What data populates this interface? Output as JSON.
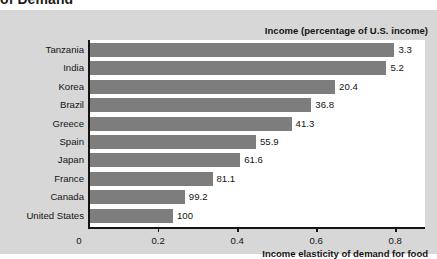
{
  "figure": {
    "clipped_caption": "of Demand",
    "header_note": "Income (percentage of U.S. income)",
    "x_axis_title": "Income elasticity of demand for food"
  },
  "colors": {
    "panel_background": "#d7d7d7",
    "plot_background": "#ffffff",
    "bar_fill": "#7d7d7d",
    "axis": "#141414",
    "text": "#141414"
  },
  "chart_data": {
    "type": "bar",
    "orientation": "horizontal",
    "title": "of Demand",
    "xlabel": "Income elasticity of demand for food",
    "ylabel": "",
    "xlim": [
      0,
      0.85
    ],
    "ticks": [
      "0",
      "0.2",
      "0.4",
      "0.6",
      "0.8"
    ],
    "tick_values": [
      0,
      0.2,
      0.4,
      0.6,
      0.8
    ],
    "grid": false,
    "legend": "none",
    "value_label_header": "Income (percentage of U.S. income)",
    "categories": [
      "Tanzania",
      "India",
      "Korea",
      "Brazil",
      "Greece",
      "Spain",
      "Japan",
      "France",
      "Canada",
      "United States"
    ],
    "values": [
      0.77,
      0.75,
      0.62,
      0.56,
      0.51,
      0.42,
      0.38,
      0.31,
      0.24,
      0.21
    ],
    "data_labels": [
      "3.3",
      "5.2",
      "20.4",
      "36.8",
      "41.3",
      "55.9",
      "61.6",
      "81.1",
      "99.2",
      "100"
    ],
    "income_percent_of_us": [
      3.3,
      5.2,
      20.4,
      36.8,
      41.3,
      55.9,
      61.6,
      81.1,
      99.2,
      100
    ]
  }
}
